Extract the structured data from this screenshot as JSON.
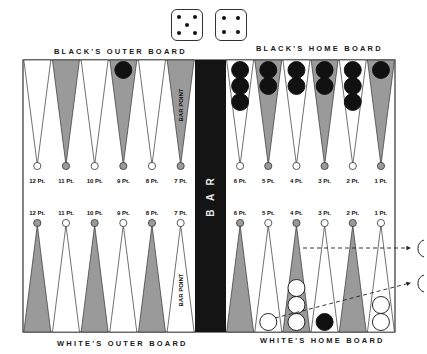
{
  "labels": {
    "black_outer": "BLACK'S OUTER BOARD",
    "black_home": "BLACK'S HOME BOARD",
    "white_outer": "WHITE'S OUTER BOARD",
    "white_home": "WHITE'S HOME BOARD",
    "bar": "BAR",
    "bar_point_top": "BAR POINT",
    "bar_point_bottom": "BAR POINT"
  },
  "dice": [
    {
      "value": 5
    },
    {
      "value": 4
    }
  ],
  "colors": {
    "board_bg": "#ffffff",
    "dark_point": "#9a9a9a",
    "light_point": "#ffffff",
    "bar": "#141414",
    "black_checker": "#111111",
    "white_checker": "#ffffff",
    "outline": "#333333"
  },
  "top_points": [
    {
      "label": "12 Pt.",
      "shade": "light",
      "checkers": 0,
      "color": ""
    },
    {
      "label": "11 Pt.",
      "shade": "dark",
      "checkers": 0,
      "color": ""
    },
    {
      "label": "10 Pt.",
      "shade": "light",
      "checkers": 0,
      "color": ""
    },
    {
      "label": "9 Pt.",
      "shade": "dark",
      "checkers": 1,
      "color": "black"
    },
    {
      "label": "8 Pt.",
      "shade": "light",
      "checkers": 0,
      "color": ""
    },
    {
      "label": "7 Pt.",
      "shade": "dark",
      "checkers": 0,
      "color": ""
    },
    {
      "label": "6 Pt.",
      "shade": "light",
      "checkers": 3,
      "color": "black"
    },
    {
      "label": "5 Pt.",
      "shade": "dark",
      "checkers": 2,
      "color": "black"
    },
    {
      "label": "4 Pt.",
      "shade": "light",
      "checkers": 2,
      "color": "black"
    },
    {
      "label": "3 Pt.",
      "shade": "dark",
      "checkers": 2,
      "color": "black"
    },
    {
      "label": "2 Pt.",
      "shade": "light",
      "checkers": 3,
      "color": "black"
    },
    {
      "label": "1 Pt.",
      "shade": "dark",
      "checkers": 1,
      "color": "black"
    }
  ],
  "bottom_points": [
    {
      "label": "12 Pt.",
      "shade": "dark",
      "checkers": 0,
      "color": ""
    },
    {
      "label": "11 Pt.",
      "shade": "light",
      "checkers": 0,
      "color": ""
    },
    {
      "label": "10 Pt.",
      "shade": "dark",
      "checkers": 0,
      "color": ""
    },
    {
      "label": "9 Pt.",
      "shade": "light",
      "checkers": 0,
      "color": ""
    },
    {
      "label": "8 Pt.",
      "shade": "dark",
      "checkers": 0,
      "color": ""
    },
    {
      "label": "7 Pt.",
      "shade": "light",
      "checkers": 0,
      "color": ""
    },
    {
      "label": "6 Pt.",
      "shade": "dark",
      "checkers": 0,
      "color": ""
    },
    {
      "label": "5 Pt.",
      "shade": "light",
      "checkers": 1,
      "color": "white"
    },
    {
      "label": "4 Pt.",
      "shade": "dark",
      "checkers": 3,
      "color": "white"
    },
    {
      "label": "3 Pt.",
      "shade": "light",
      "checkers": 1,
      "color": "black"
    },
    {
      "label": "2 Pt.",
      "shade": "dark",
      "checkers": 0,
      "color": ""
    },
    {
      "label": "1 Pt.",
      "shade": "light",
      "checkers": 2,
      "color": "white"
    }
  ],
  "bear_off_arrows": [
    {
      "from": "4 Pt.",
      "to": "off-upper"
    },
    {
      "from": "5 Pt.",
      "to": "off-lower"
    }
  ]
}
